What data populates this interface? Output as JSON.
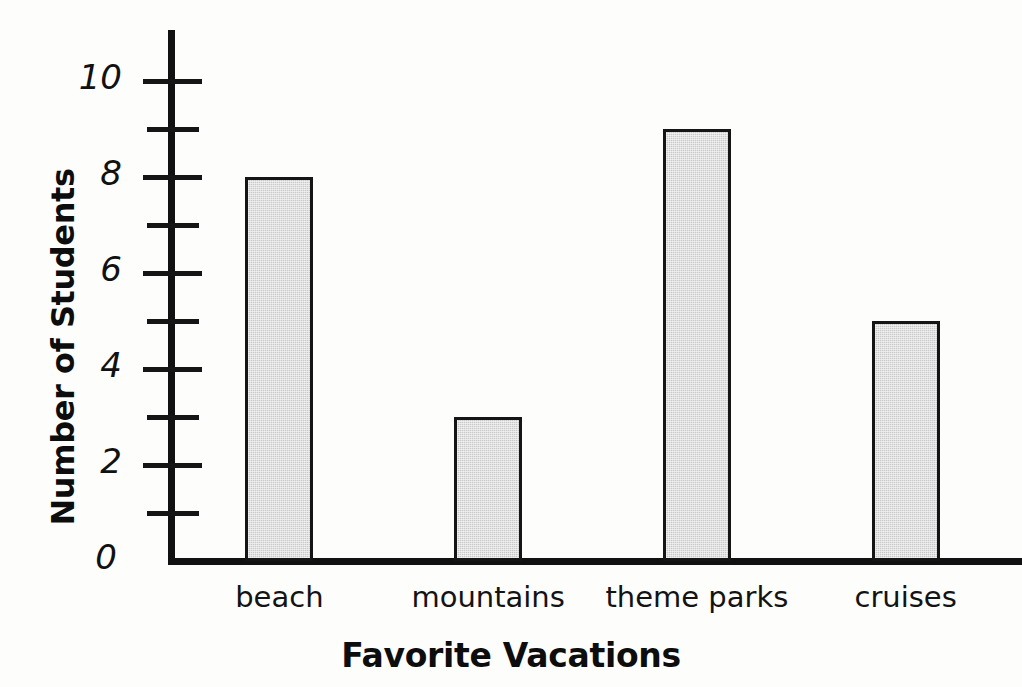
{
  "chart_data": {
    "type": "bar",
    "title": "",
    "xlabel": "Favorite Vacations",
    "ylabel": "Number of Students",
    "categories": [
      "beach",
      "mountains",
      "theme parks",
      "cruises"
    ],
    "values": [
      8,
      3,
      9,
      5
    ],
    "ylim": [
      0,
      11
    ],
    "y_major_ticks": [
      0,
      2,
      4,
      6,
      8,
      10
    ],
    "y_minor_ticks": [
      1,
      3,
      5,
      7,
      9
    ],
    "y_tick_labels": [
      "0",
      "2",
      "4",
      "6",
      "8",
      "10"
    ],
    "grid": false,
    "legend": false,
    "bar_fill_color": "#c9c9c9",
    "bar_border_color": "#151515",
    "axis_color": "#111111",
    "background_color": "#ffffff"
  }
}
